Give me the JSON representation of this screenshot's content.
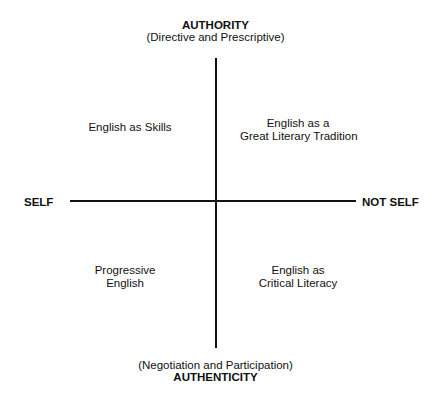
{
  "axes": {
    "top": {
      "title": "AUTHORITY",
      "subtitle": "(Directive and Prescriptive)"
    },
    "bottom": {
      "title": "AUTHENTICITY",
      "subtitle": "(Negotiation and Participation)"
    },
    "left": {
      "title": "SELF"
    },
    "right": {
      "title": "NOT SELF"
    }
  },
  "quadrants": {
    "top_left": {
      "lines": [
        "English as Skills"
      ]
    },
    "top_right": {
      "lines": [
        "English as a",
        "Great Literary Tradition"
      ]
    },
    "bottom_left": {
      "lines": [
        "Progressive",
        "English"
      ]
    },
    "bottom_right": {
      "lines": [
        "English as",
        "Critical Literacy"
      ]
    }
  },
  "colors": {
    "ink": "#111111",
    "background": "#ffffff"
  }
}
